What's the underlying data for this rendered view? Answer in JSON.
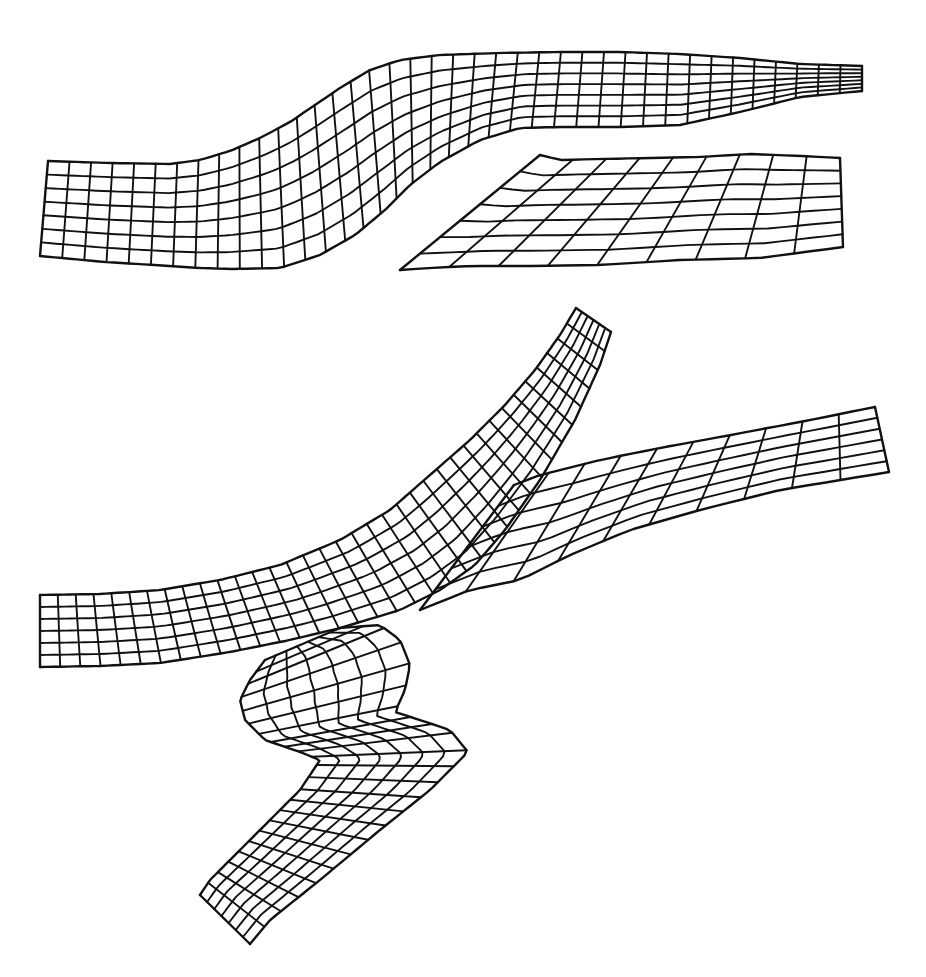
{
  "figure": {
    "background": "#ffffff",
    "line_color": "#111111",
    "meshes": [
      {
        "id": "top-mesh",
        "description": "Symmetric bifurcation mesh (planar)",
        "patches": [
          {
            "id": "trunk-and-upper-branch",
            "bands": 7,
            "side_a": [
              [
                48,
                161
              ],
              [
                110,
                163
              ],
              [
                170,
                164
              ],
              [
                200,
                160
              ],
              [
                230,
                151
              ],
              [
                260,
                138
              ],
              [
                290,
                122
              ],
              [
                315,
                105
              ],
              [
                340,
                88
              ],
              [
                370,
                70
              ],
              [
                400,
                60
              ],
              [
                440,
                55
              ],
              [
                500,
                53
              ],
              [
                560,
                52
              ],
              [
                620,
                52
              ],
              [
                680,
                54
              ],
              [
                740,
                58
              ],
              [
                800,
                64
              ],
              [
                862,
                66
              ]
            ],
            "side_b": [
              [
                40,
                256
              ],
              [
                105,
                262
              ],
              [
                170,
                266
              ],
              [
                200,
                268
              ],
              [
                230,
                269
              ],
              [
                280,
                268
              ],
              [
                320,
                255
              ],
              [
                355,
                235
              ],
              [
                385,
                210
              ],
              [
                410,
                185
              ],
              [
                440,
                162
              ],
              [
                480,
                140
              ],
              [
                520,
                128
              ],
              [
                560,
                127
              ],
              [
                620,
                127
              ],
              [
                680,
                125
              ],
              [
                740,
                112
              ],
              [
                800,
                97
              ],
              [
                862,
                91
              ]
            ]
          },
          {
            "id": "lower-branch",
            "bands": 7,
            "side_a": [
              [
                540,
                155
              ],
              [
                560,
                160
              ],
              [
                600,
                159
              ],
              [
                650,
                158
              ],
              [
                700,
                157
              ],
              [
                750,
                154
              ],
              [
                800,
                156
              ],
              [
                840,
                158
              ]
            ],
            "side_b": [
              [
                400,
                270
              ],
              [
                430,
                268
              ],
              [
                470,
                266
              ],
              [
                530,
                266
              ],
              [
                600,
                265
              ],
              [
                680,
                260
              ],
              [
                760,
                258
              ],
              [
                843,
                247
              ]
            ]
          }
        ]
      },
      {
        "id": "bottom-mesh",
        "description": "Tortuous bifurcation with aneurysm-like bulge",
        "patches": [
          {
            "id": "inlet-and-upper-branch",
            "bands": 6,
            "side_a": [
              [
                40,
                595
              ],
              [
                100,
                594
              ],
              [
                160,
                590
              ],
              [
                220,
                580
              ],
              [
                280,
                565
              ],
              [
                340,
                540
              ],
              [
                390,
                510
              ],
              [
                430,
                475
              ],
              [
                470,
                440
              ],
              [
                505,
                405
              ],
              [
                535,
                370
              ],
              [
                560,
                335
              ],
              [
                576,
                308
              ]
            ],
            "side_b": [
              [
                40,
                667
              ],
              [
                100,
                666
              ],
              [
                160,
                663
              ],
              [
                230,
                652
              ],
              [
                290,
                640
              ],
              [
                340,
                628
              ],
              [
                400,
                610
              ],
              [
                440,
                590
              ],
              [
                475,
                565
              ],
              [
                505,
                530
              ],
              [
                540,
                480
              ],
              [
                575,
                420
              ],
              [
                600,
                365
              ],
              [
                611,
                332
              ]
            ]
          },
          {
            "id": "right-branch",
            "bands": 6,
            "side_a": [
              [
                514,
                485
              ],
              [
                540,
                475
              ],
              [
                600,
                460
              ],
              [
                660,
                448
              ],
              [
                720,
                437
              ],
              [
                800,
                422
              ],
              [
                875,
                407
              ]
            ],
            "side_b": [
              [
                420,
                610
              ],
              [
                470,
                590
              ],
              [
                520,
                580
              ],
              [
                570,
                555
              ],
              [
                630,
                530
              ],
              [
                700,
                510
              ],
              [
                780,
                490
              ],
              [
                889,
                472
              ]
            ]
          },
          {
            "id": "bulge-and-outlet",
            "bands": 7,
            "side_a": [
              [
                340,
                628
              ],
              [
                380,
                625
              ],
              [
                400,
                640
              ],
              [
                410,
                665
              ],
              [
                405,
                690
              ],
              [
                395,
                712
              ],
              [
                420,
                720
              ],
              [
                450,
                730
              ],
              [
                468,
                752
              ],
              [
                430,
                790
              ],
              [
                380,
                830
              ],
              [
                320,
                880
              ],
              [
                270,
                920
              ],
              [
                250,
                944
              ]
            ],
            "side_b": [
              [
                265,
                660
              ],
              [
                250,
                680
              ],
              [
                240,
                700
              ],
              [
                245,
                720
              ],
              [
                265,
                740
              ],
              [
                300,
                752
              ],
              [
                320,
                760
              ],
              [
                300,
                790
              ],
              [
                270,
                820
              ],
              [
                240,
                850
              ],
              [
                210,
                880
              ],
              [
                200,
                895
              ]
            ]
          }
        ]
      }
    ]
  }
}
